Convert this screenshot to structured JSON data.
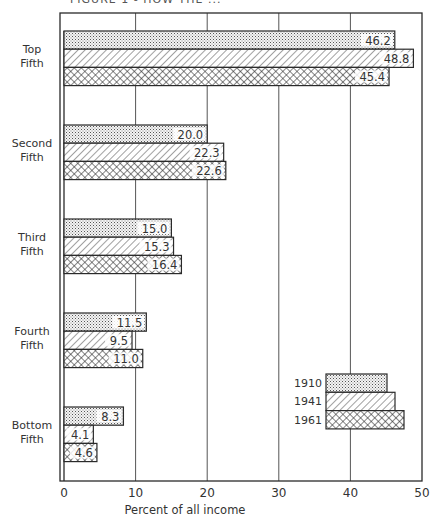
{
  "header": {
    "caption": "FIGURE 1 - HOW THE ..."
  },
  "chart_data": {
    "type": "bar",
    "orientation": "horizontal",
    "title": "",
    "xlabel": "Percent of all income",
    "ylabel": "",
    "xlim": [
      0,
      50
    ],
    "x_ticks": [
      0,
      10,
      20,
      30,
      40,
      50
    ],
    "grid": {
      "vertical": true,
      "horizontal": false
    },
    "legend_position": "inside lower right",
    "categories": [
      "Top Fifth",
      "Second Fifth",
      "Third Fifth",
      "Fourth Fifth",
      "Bottom Fifth"
    ],
    "category_lines": [
      [
        "Top",
        "Fifth"
      ],
      [
        "Second",
        "Fifth"
      ],
      [
        "Third",
        "Fifth"
      ],
      [
        "Fourth",
        "Fifth"
      ],
      [
        "Bottom",
        "Fifth"
      ]
    ],
    "series": [
      {
        "name": "1910",
        "pattern": "dots",
        "values": [
          46.2,
          20.0,
          15.0,
          11.5,
          8.3
        ],
        "labels": [
          "46.2",
          "20.0",
          "15.0",
          "11.5",
          "8.3"
        ]
      },
      {
        "name": "1941",
        "pattern": "diagonal",
        "values": [
          48.8,
          22.3,
          15.3,
          9.5,
          4.1
        ],
        "labels": [
          "48.8",
          "22.3",
          "15.3",
          "9.5",
          "4.1"
        ]
      },
      {
        "name": "1961",
        "pattern": "crosshatch",
        "values": [
          45.4,
          22.6,
          16.4,
          11.0,
          4.6
        ],
        "labels": [
          "45.4",
          "22.6",
          "16.4",
          "11.0",
          "4.6"
        ]
      }
    ],
    "legend": [
      {
        "label": "1910",
        "pattern": "dots"
      },
      {
        "label": "1941",
        "pattern": "diagonal"
      },
      {
        "label": "1961",
        "pattern": "crosshatch"
      }
    ]
  },
  "style": {
    "ink": "#2a2a2a",
    "paper": "#ffffff",
    "grid": "#555555"
  }
}
